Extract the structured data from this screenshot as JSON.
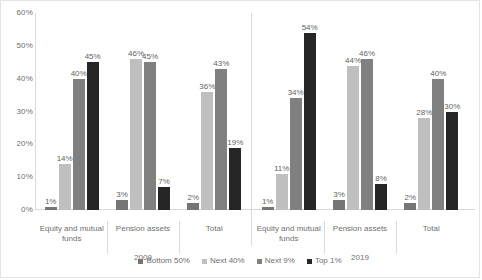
{
  "chart_data": {
    "type": "bar",
    "title": "",
    "xlabel": "",
    "ylabel": "",
    "ylim": [
      0,
      60
    ],
    "grid": false,
    "legend_position": "bottom",
    "y_ticks": [
      "0%",
      "10%",
      "20%",
      "30%",
      "40%",
      "50%",
      "60%"
    ],
    "y_tick_values": [
      0,
      10,
      20,
      30,
      40,
      50,
      60
    ],
    "categories": [
      "Equity and mutual funds",
      "Pension assets",
      "Total"
    ],
    "panels": [
      "2009",
      "2019"
    ],
    "series": [
      {
        "name": "Bottom 50%",
        "color": "#757575",
        "values_2009": [
          1,
          3,
          2
        ],
        "values_2019": [
          1,
          3,
          2
        ],
        "labels_2009": [
          "1%",
          "3%",
          "2%"
        ],
        "labels_2019": [
          "1%",
          "3%",
          "2%"
        ]
      },
      {
        "name": "Next 40%",
        "color": "#bfbfbf",
        "values_2009": [
          14,
          46,
          36
        ],
        "values_2019": [
          11,
          44,
          28
        ],
        "labels_2009": [
          "14%",
          "46%",
          "36%"
        ],
        "labels_2019": [
          "11%",
          "44%",
          "28%"
        ]
      },
      {
        "name": "Next 9%",
        "color": "#808080",
        "values_2009": [
          40,
          45,
          43
        ],
        "values_2019": [
          34,
          46,
          40
        ],
        "labels_2009": [
          "40%",
          "45%",
          "43%"
        ],
        "labels_2019": [
          "34%",
          "46%",
          "40%"
        ]
      },
      {
        "name": "Top 1%",
        "color": "#262626",
        "values_2009": [
          45,
          7,
          19
        ],
        "values_2019": [
          54,
          8,
          30
        ],
        "labels_2009": [
          "45%",
          "7%",
          "19%"
        ],
        "labels_2019": [
          "54%",
          "8%",
          "30%"
        ]
      }
    ]
  },
  "axis": {
    "y_ticks": [
      {
        "label": "60%",
        "value": 60
      },
      {
        "label": "50%",
        "value": 50
      },
      {
        "label": "40%",
        "value": 40
      },
      {
        "label": "30%",
        "value": 30
      },
      {
        "label": "20%",
        "value": 20
      },
      {
        "label": "10%",
        "value": 10
      },
      {
        "label": "0%",
        "value": 0
      }
    ]
  },
  "panels": [
    {
      "caption": "2009",
      "categories": [
        {
          "caption_line1": "Equity and mutual",
          "caption_line2": "funds",
          "bars": [
            {
              "series": "Bottom 50%",
              "value": 1,
              "label": "1%",
              "color": "#757575"
            },
            {
              "series": "Next 40%",
              "value": 14,
              "label": "14%",
              "color": "#bfbfbf"
            },
            {
              "series": "Next 9%",
              "value": 40,
              "label": "40%",
              "color": "#808080"
            },
            {
              "series": "Top 1%",
              "value": 45,
              "label": "45%",
              "color": "#262626"
            }
          ]
        },
        {
          "caption_line1": "Pension assets",
          "caption_line2": "",
          "bars": [
            {
              "series": "Bottom 50%",
              "value": 3,
              "label": "3%",
              "color": "#757575"
            },
            {
              "series": "Next 40%",
              "value": 46,
              "label": "46%",
              "color": "#bfbfbf"
            },
            {
              "series": "Next 9%",
              "value": 45,
              "label": "45%",
              "color": "#808080"
            },
            {
              "series": "Top 1%",
              "value": 7,
              "label": "7%",
              "color": "#262626"
            }
          ]
        },
        {
          "caption_line1": "Total",
          "caption_line2": "",
          "bars": [
            {
              "series": "Bottom 50%",
              "value": 2,
              "label": "2%",
              "color": "#757575"
            },
            {
              "series": "Next 40%",
              "value": 36,
              "label": "36%",
              "color": "#bfbfbf"
            },
            {
              "series": "Next 9%",
              "value": 43,
              "label": "43%",
              "color": "#808080"
            },
            {
              "series": "Top 1%",
              "value": 19,
              "label": "19%",
              "color": "#262626"
            }
          ]
        }
      ]
    },
    {
      "caption": "2019",
      "categories": [
        {
          "caption_line1": "Equity and mutual",
          "caption_line2": "funds",
          "bars": [
            {
              "series": "Bottom 50%",
              "value": 1,
              "label": "1%",
              "color": "#757575"
            },
            {
              "series": "Next 40%",
              "value": 11,
              "label": "11%",
              "color": "#bfbfbf"
            },
            {
              "series": "Next 9%",
              "value": 34,
              "label": "34%",
              "color": "#808080"
            },
            {
              "series": "Top 1%",
              "value": 54,
              "label": "54%",
              "color": "#262626"
            }
          ]
        },
        {
          "caption_line1": "Pension assets",
          "caption_line2": "",
          "bars": [
            {
              "series": "Bottom 50%",
              "value": 3,
              "label": "3%",
              "color": "#757575"
            },
            {
              "series": "Next 40%",
              "value": 44,
              "label": "44%",
              "color": "#bfbfbf"
            },
            {
              "series": "Next 9%",
              "value": 46,
              "label": "46%",
              "color": "#808080"
            },
            {
              "series": "Top 1%",
              "value": 8,
              "label": "8%",
              "color": "#262626"
            }
          ]
        },
        {
          "caption_line1": "Total",
          "caption_line2": "",
          "bars": [
            {
              "series": "Bottom 50%",
              "value": 2,
              "label": "2%",
              "color": "#757575"
            },
            {
              "series": "Next 40%",
              "value": 28,
              "label": "28%",
              "color": "#bfbfbf"
            },
            {
              "series": "Next 9%",
              "value": 40,
              "label": "40%",
              "color": "#808080"
            },
            {
              "series": "Top 1%",
              "value": 30,
              "label": "30%",
              "color": "#262626"
            }
          ]
        }
      ]
    }
  ],
  "legend": {
    "items": [
      {
        "label": "Bottom 50%",
        "color": "#757575"
      },
      {
        "label": "Next 40%",
        "color": "#bfbfbf"
      },
      {
        "label": "Next 9%",
        "color": "#808080"
      },
      {
        "label": "Top 1%",
        "color": "#262626"
      }
    ]
  }
}
